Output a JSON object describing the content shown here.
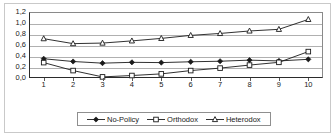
{
  "chart_data": {
    "type": "line",
    "title": "",
    "subtitle": "",
    "xlabel": "",
    "ylabel": "",
    "xlim": [
      1,
      10
    ],
    "ylim": [
      0.0,
      1.2
    ],
    "grid": true,
    "legend_position": "bottom",
    "decimal_separator": ",",
    "categories": [
      1,
      2,
      3,
      4,
      5,
      6,
      7,
      8,
      9,
      10
    ],
    "x_tick_labels": [
      "1",
      "2",
      "3",
      "4",
      "5",
      "6",
      "7",
      "8",
      "9",
      "10"
    ],
    "y_ticks": [
      0.0,
      0.2,
      0.4,
      0.6,
      0.8,
      1.0,
      1.2
    ],
    "y_tick_labels": [
      "0,0",
      "0,2",
      "0,4",
      "0,6",
      "0,8",
      "1,0",
      "1,2"
    ],
    "series": [
      {
        "name": "No-Policy",
        "marker": "filled-diamond",
        "color": "#1a1a1a",
        "values": [
          0.35,
          0.3,
          0.27,
          0.285,
          0.28,
          0.295,
          0.305,
          0.325,
          0.31,
          0.34
        ]
      },
      {
        "name": "Orthodox",
        "marker": "open-square",
        "color": "#1a1a1a",
        "values": [
          0.28,
          0.135,
          0.02,
          0.045,
          0.075,
          0.135,
          0.18,
          0.235,
          0.285,
          0.48
        ]
      },
      {
        "name": "Heterodox",
        "marker": "open-triangle",
        "color": "#1a1a1a",
        "values": [
          0.715,
          0.625,
          0.635,
          0.675,
          0.72,
          0.775,
          0.81,
          0.855,
          0.885,
          1.065
        ]
      }
    ]
  },
  "legend": {
    "items": [
      {
        "label": "No-Policy",
        "marker": "filled-diamond"
      },
      {
        "label": "Orthodox",
        "marker": "open-square"
      },
      {
        "label": "Heterodox",
        "marker": "open-triangle"
      }
    ]
  }
}
